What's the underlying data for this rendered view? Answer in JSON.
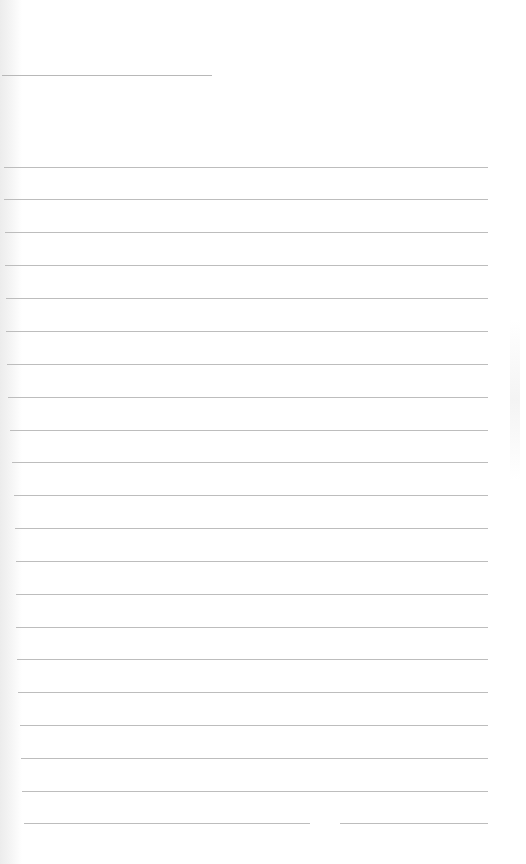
{
  "page": {
    "type": "lined-notebook-page",
    "background": "#ffffff",
    "rule_color": "#bdbdbd",
    "title_line": {
      "x": 2,
      "y": 75,
      "width": 210
    },
    "rules": [
      {
        "y": 167,
        "x": 4,
        "width": 484
      },
      {
        "y": 199,
        "x": 4,
        "width": 484
      },
      {
        "y": 232,
        "x": 5,
        "width": 483
      },
      {
        "y": 265,
        "x": 5,
        "width": 483
      },
      {
        "y": 298,
        "x": 6,
        "width": 482
      },
      {
        "y": 331,
        "x": 6,
        "width": 482
      },
      {
        "y": 364,
        "x": 7,
        "width": 481
      },
      {
        "y": 397,
        "x": 8,
        "width": 480
      },
      {
        "y": 430,
        "x": 10,
        "width": 478
      },
      {
        "y": 462,
        "x": 12,
        "width": 476
      },
      {
        "y": 495,
        "x": 14,
        "width": 474
      },
      {
        "y": 528,
        "x": 15,
        "width": 473
      },
      {
        "y": 561,
        "x": 16,
        "width": 472
      },
      {
        "y": 594,
        "x": 16,
        "width": 472
      },
      {
        "y": 627,
        "x": 16,
        "width": 472
      },
      {
        "y": 659,
        "x": 17,
        "width": 471
      },
      {
        "y": 692,
        "x": 18,
        "width": 470
      },
      {
        "y": 725,
        "x": 20,
        "width": 468
      },
      {
        "y": 758,
        "x": 21,
        "width": 467
      },
      {
        "y": 791,
        "x": 22,
        "width": 466
      },
      {
        "y": 823,
        "x": 24,
        "width": 464,
        "gap": {
          "x": 310,
          "width": 30
        }
      }
    ]
  }
}
